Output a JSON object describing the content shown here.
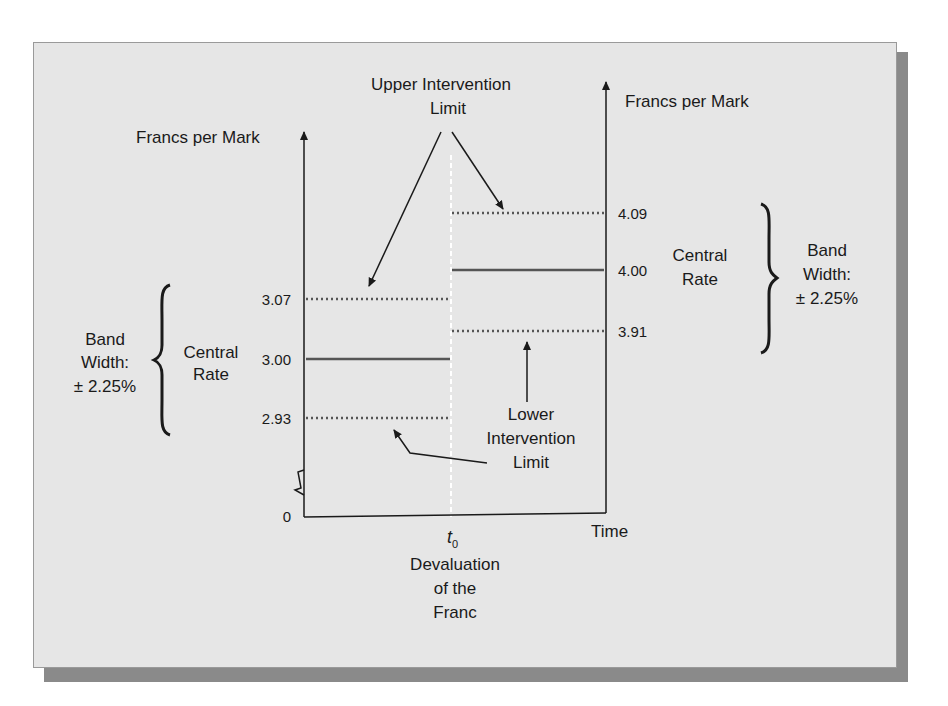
{
  "diagram": {
    "left_axis": {
      "title": "Francs per Mark",
      "origin_label": "0",
      "levels": [
        {
          "name": "upper",
          "value": "3.07",
          "style": "dotted"
        },
        {
          "name": "central",
          "value": "3.00",
          "style": "solid"
        },
        {
          "name": "lower",
          "value": "2.93",
          "style": "dotted"
        }
      ],
      "central_label_line1": "Central",
      "central_label_line2": "Rate",
      "band_label_line1": "Band",
      "band_label_line2": "Width:",
      "band_label_line3": "± 2.25%"
    },
    "right_axis": {
      "title": "Francs per Mark",
      "levels": [
        {
          "name": "upper",
          "value": "4.09",
          "style": "dotted"
        },
        {
          "name": "central",
          "value": "4.00",
          "style": "solid"
        },
        {
          "name": "lower",
          "value": "3.91",
          "style": "dotted"
        }
      ],
      "central_label_line1": "Central",
      "central_label_line2": "Rate",
      "band_label_line1": "Band",
      "band_label_line2": "Width:",
      "band_label_line3": "± 2.25%"
    },
    "upper_intervention": {
      "line1": "Upper Intervention",
      "line2": "Limit"
    },
    "lower_intervention": {
      "line1": "Lower",
      "line2": "Intervention",
      "line3": "Limit"
    },
    "x_axis": {
      "label": "Time",
      "event_tick": "t",
      "event_tick_sub": "0",
      "event_line1": "Devaluation",
      "event_line2": "of the",
      "event_line3": "Franc"
    },
    "colors": {
      "panel": "#e6e6e6",
      "shadow": "#8a8a8a",
      "line": "#1a1a1a",
      "level_line": "#555555",
      "divider": "#ffffff"
    }
  }
}
